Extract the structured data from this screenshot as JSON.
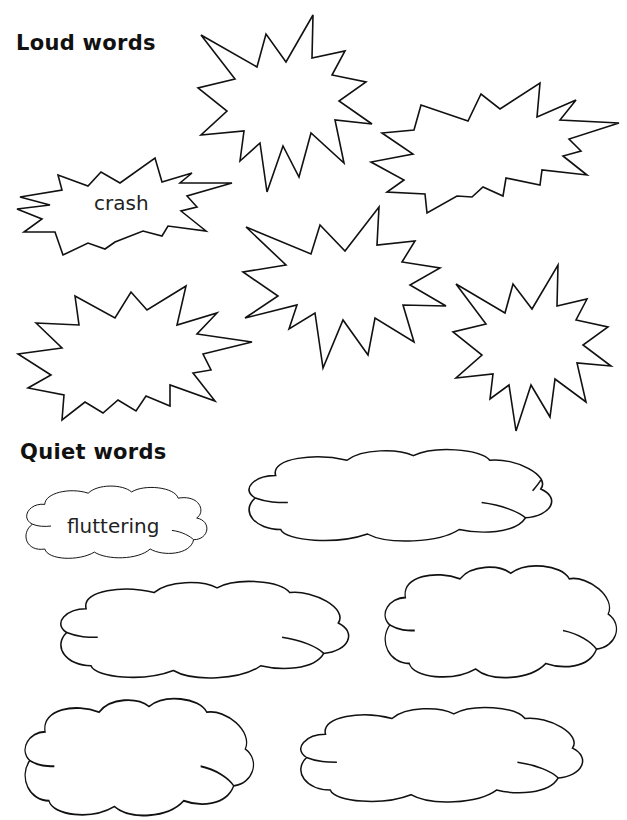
{
  "sections": {
    "loud": {
      "title": "Loud words",
      "example_word": "crash",
      "shape": "starburst-icon",
      "blank_count": 6
    },
    "quiet": {
      "title": "Quiet words",
      "example_word": "fluttering",
      "shape": "cloud-icon",
      "blank_count": 5
    }
  }
}
